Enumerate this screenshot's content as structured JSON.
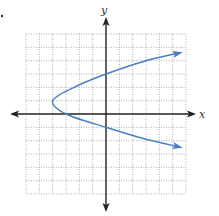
{
  "chart_data": {
    "type": "line",
    "title": "",
    "xlabel": "x",
    "ylabel": "y",
    "xlim": [
      -6,
      6
    ],
    "ylim": [
      -6,
      6
    ],
    "grid": true,
    "grid_style": "dotted",
    "tick_labels": false,
    "legend": null,
    "series": [
      {
        "name": "sideways parabola",
        "equation_estimate": "x = (y - 1)^2 - 4",
        "color": "#4a7fc1",
        "vertex": [
          -4,
          1
        ],
        "x_intercept": [
          -3,
          0
        ],
        "y_intercepts": [
          [
            0,
            3
          ],
          [
            0,
            -1
          ]
        ],
        "arrow_ends": [
          [
            5.6,
            4.6
          ],
          [
            5.6,
            -2.5
          ]
        ],
        "points": [
          [
            5.6,
            4.6
          ],
          [
            3.0,
            4.0
          ],
          [
            0,
            3
          ],
          [
            -2.4,
            2.0
          ],
          [
            -4,
            1
          ],
          [
            -3,
            0
          ],
          [
            0,
            -1
          ],
          [
            3.0,
            -1.9
          ],
          [
            5.6,
            -2.5
          ]
        ]
      }
    ]
  },
  "colors": {
    "curve": "#4a7fc1",
    "axis": "#222222",
    "grid": "#9a9a9a",
    "background": "#ffffff"
  },
  "labels": {
    "x_axis": "x",
    "y_axis": "y"
  }
}
